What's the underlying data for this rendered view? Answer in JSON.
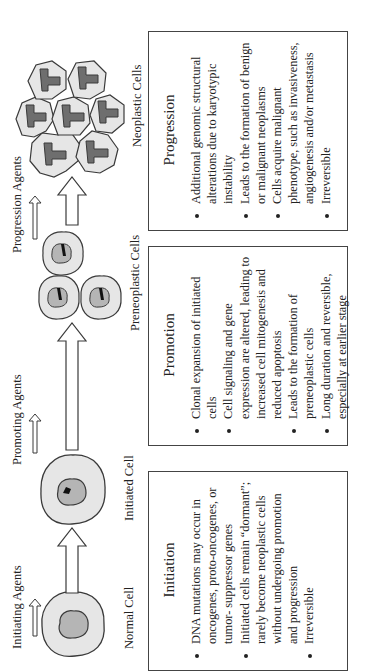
{
  "agents": {
    "initiating": "Initiating Agents",
    "promoting": "Promoting Agents",
    "progression": "Progression Agents"
  },
  "cells": {
    "normal": "Normal Cell",
    "initiated": "Initiated Cell",
    "preneoplastic": "Preneoplastic  Cells",
    "neoplastic": "Neoplastic Cells"
  },
  "stages": [
    {
      "title": "Initiation",
      "bullets": [
        "DNA mutations may occur in oncogenes, proto-oncogenes, or tumor- suppressor genes",
        "Initiated cells remain “dormant”; rarely become neoplastic cells without undergoing promotion and progression",
        "Irreversible"
      ]
    },
    {
      "title": "Promotion",
      "bullets": [
        "Clonal expansion of initiated cells",
        "Cell signaling and gene expression are altered, leading to increased cell mitogenesis and reduced apoptosis",
        "Leads to the formation of preneoplastic cells",
        "Long duration and reversible, especially at earlier stage"
      ]
    },
    {
      "title": "Progression",
      "bullets": [
        "Additional genomic structural alterations due to karyotypic instability",
        "Leads to the formation of benign or malignant neoplasms",
        "Cells acquire malignant phenotype, such as invasiveness, angiogenesis and/or metastasis",
        "Irreversible"
      ]
    }
  ],
  "colors": {
    "cytoplasm": "#e6e6e6",
    "nucleus_light": "#b5b5b5",
    "nucleus_dark": "#6e6e6e",
    "outline": "#3a3a3a"
  }
}
